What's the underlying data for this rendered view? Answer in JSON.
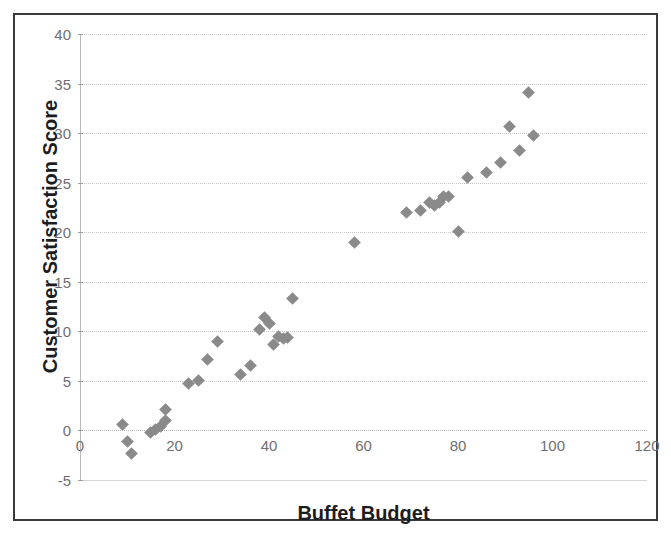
{
  "clipped_caption": "",
  "chart_data": {
    "type": "scatter",
    "title": "",
    "xlabel": "Buffet Budget",
    "ylabel": "Customer Satisfaction Score",
    "xlim": [
      0,
      120
    ],
    "ylim": [
      -5,
      40
    ],
    "xticks": [
      0,
      20,
      40,
      60,
      80,
      100,
      120
    ],
    "yticks": [
      -5,
      0,
      5,
      10,
      15,
      20,
      25,
      30,
      35,
      40
    ],
    "grid": true,
    "legend": false,
    "marker": "diamond",
    "marker_color": "#8a8a8a",
    "series": [
      {
        "name": "Buffet Budget vs Customer Satisfaction Score",
        "points": [
          [
            9,
            0.6
          ],
          [
            10,
            -1.1
          ],
          [
            11,
            -2.3
          ],
          [
            15,
            -0.2
          ],
          [
            16,
            0.1
          ],
          [
            17,
            0.4
          ],
          [
            18,
            1.0
          ],
          [
            18,
            2.1
          ],
          [
            23,
            4.7
          ],
          [
            25,
            5.0
          ],
          [
            27,
            7.2
          ],
          [
            29,
            9.0
          ],
          [
            34,
            5.6
          ],
          [
            36,
            6.6
          ],
          [
            38,
            10.2
          ],
          [
            39,
            11.4
          ],
          [
            40,
            10.8
          ],
          [
            41,
            8.7
          ],
          [
            42,
            9.5
          ],
          [
            43,
            9.3
          ],
          [
            44,
            9.4
          ],
          [
            45,
            13.3
          ],
          [
            58,
            19.0
          ],
          [
            69,
            22.0
          ],
          [
            72,
            22.2
          ],
          [
            74,
            23.0
          ],
          [
            75,
            22.7
          ],
          [
            76,
            23.0
          ],
          [
            77,
            23.6
          ],
          [
            78,
            23.6
          ],
          [
            80,
            20.1
          ],
          [
            82,
            25.5
          ],
          [
            86,
            26.0
          ],
          [
            89,
            27.0
          ],
          [
            91,
            30.7
          ],
          [
            93,
            28.2
          ],
          [
            95,
            34.1
          ],
          [
            96,
            29.8
          ]
        ]
      }
    ]
  }
}
